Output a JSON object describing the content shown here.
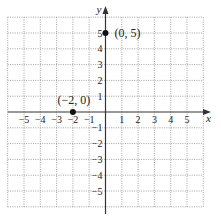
{
  "chart_data": {
    "type": "scatter",
    "title": "",
    "xlabel": "x",
    "ylabel": "y",
    "xlim": [
      -6,
      6
    ],
    "ylim": [
      -6,
      6
    ],
    "grid": true,
    "x_ticks": [
      -5,
      -4,
      -3,
      -2,
      -1,
      1,
      2,
      3,
      4,
      5
    ],
    "y_ticks": [
      -5,
      -4,
      -3,
      -2,
      -1,
      1,
      2,
      3,
      4,
      5
    ],
    "x_tick_labels": [
      "−5",
      "−4",
      "−3",
      "−2",
      "−1",
      "1",
      "2",
      "3",
      "4",
      "5"
    ],
    "y_tick_labels": [
      "−5",
      "−4",
      "−3",
      "−2",
      "−1",
      "1",
      "2",
      "3",
      "4",
      "5"
    ],
    "points": [
      {
        "x": 0,
        "y": 5,
        "label": "(0, 5)"
      },
      {
        "x": -2,
        "y": 0,
        "label": "(−2, 0)"
      }
    ],
    "colors": {
      "axis": "#333333",
      "grid": "#8a8a8a",
      "point": "#111111"
    }
  }
}
